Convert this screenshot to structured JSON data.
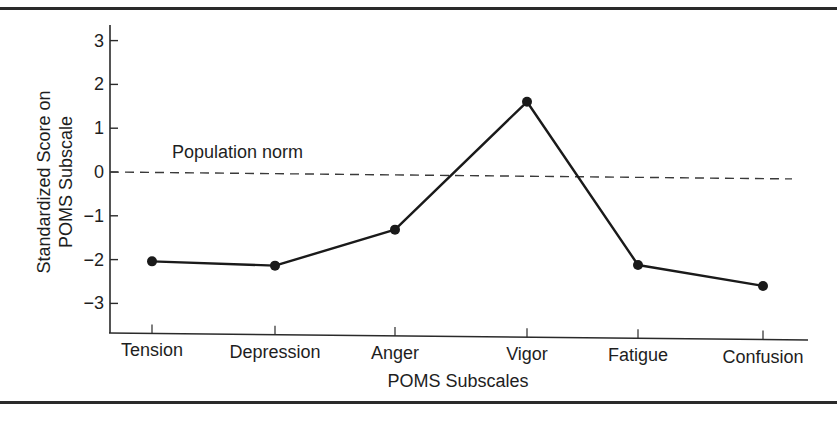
{
  "chart_data": {
    "type": "line",
    "title": "",
    "xlabel": "POMS Subscales",
    "ylabel": [
      "Standardized Score on",
      "POMS Subscale"
    ],
    "categories": [
      "Tension",
      "Depression",
      "Anger",
      "Vigor",
      "Fatigue",
      "Confusion"
    ],
    "series": [
      {
        "name": "POMS profile",
        "values": [
          -2.03,
          -2.1,
          -1.25,
          1.7,
          -2.0,
          -2.45
        ],
        "color": "#1a1a1a",
        "marker": "filled-circle"
      }
    ],
    "reference_line": {
      "label": "Population norm",
      "value": 0,
      "style": "dashed",
      "color": "#3a3a3a"
    },
    "yticks": [
      3,
      2,
      1,
      0,
      -1,
      -2,
      -3
    ],
    "ytick_labels": [
      "3",
      "2",
      "1",
      "0",
      "−1",
      "−2",
      "−3"
    ],
    "ylim": [
      -3.6,
      3.5
    ],
    "grid": false,
    "legend": "none"
  }
}
